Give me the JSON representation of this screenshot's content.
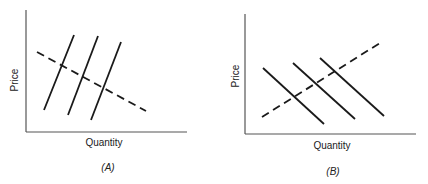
{
  "figure": {
    "panels": [
      {
        "id": "A",
        "caption": "(A)",
        "x_label": "Quantity",
        "y_label": "Price",
        "axes": {
          "origin": [
            26,
            132
          ],
          "x_end": 187,
          "y_top": 10
        },
        "solid_lines": [
          {
            "x1": 44,
            "y1": 110,
            "x2": 74,
            "y2": 35
          },
          {
            "x1": 68,
            "y1": 115,
            "x2": 98,
            "y2": 36
          },
          {
            "x1": 91,
            "y1": 120,
            "x2": 121,
            "y2": 42
          }
        ],
        "dashed_line": {
          "x1": 37,
          "y1": 52,
          "x2": 146,
          "y2": 111
        }
      },
      {
        "id": "B",
        "caption": "(B)",
        "x_label": "Quantity",
        "y_label": "Price",
        "axes": {
          "origin": [
            245,
            134
          ],
          "x_end": 416,
          "y_top": 14
        },
        "solid_lines": [
          {
            "x1": 263,
            "y1": 68,
            "x2": 324,
            "y2": 124
          },
          {
            "x1": 293,
            "y1": 63,
            "x2": 355,
            "y2": 119
          },
          {
            "x1": 320,
            "y1": 58,
            "x2": 384,
            "y2": 116
          }
        ],
        "dashed_line": {
          "x1": 262,
          "y1": 117,
          "x2": 380,
          "y2": 43
        }
      }
    ],
    "colors": {
      "ink": "#1a1a1a",
      "axis": "#555555",
      "background": "#ffffff"
    }
  }
}
